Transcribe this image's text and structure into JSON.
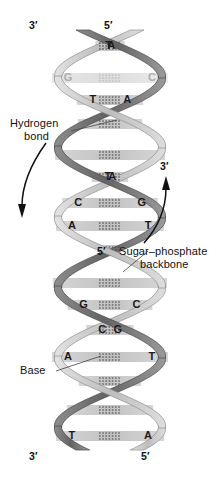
{
  "figure": {
    "type": "dna-double-helix",
    "background": "#ffffff",
    "strand_dark_color": "#6e6e6e",
    "strand_light_color": "#c9c9c9",
    "rung_color": "#c8c8c8",
    "text_color": "#111111"
  },
  "end_labels": {
    "top_left": "3′",
    "top_right": "5′",
    "middle_right": "3′",
    "middle_backbone": "5′",
    "bottom_left": "3′",
    "bottom_right": "5′"
  },
  "annotations": {
    "hydrogen_bond_line1": "Hydrogen",
    "hydrogen_bond_line2": "bond",
    "sugar_phosphate_line1": "Sugar–phosphate",
    "sugar_phosphate_line2": "backbone",
    "base": "Base"
  },
  "base_pairs": [
    {
      "index": 1,
      "left": "A",
      "right": "T",
      "y": 46,
      "labeled": true,
      "faded": false
    },
    {
      "index": 2,
      "left": "G",
      "right": "C",
      "y": 78,
      "labeled": true,
      "faded": true
    },
    {
      "index": 3,
      "left": "T",
      "right": "A",
      "y": 100,
      "labeled": true,
      "faded": false
    },
    {
      "index": 4,
      "left": "",
      "right": "",
      "y": 124,
      "labeled": false,
      "faded": false
    },
    {
      "index": 5,
      "left": "",
      "right": "",
      "y": 155,
      "labeled": false,
      "faded": false
    },
    {
      "index": 6,
      "left": "T",
      "right": "A",
      "y": 177,
      "labeled": true,
      "faded": false
    },
    {
      "index": 7,
      "left": "C",
      "right": "G",
      "y": 203,
      "labeled": true,
      "faded": false
    },
    {
      "index": 8,
      "left": "A",
      "right": "T",
      "y": 226,
      "labeled": true,
      "faded": false
    },
    {
      "index": 9,
      "left": "",
      "right": "",
      "y": 250,
      "labeled": false,
      "faded": false
    },
    {
      "index": 10,
      "left": "",
      "right": "",
      "y": 283,
      "labeled": false,
      "faded": false
    },
    {
      "index": 11,
      "left": "G",
      "right": "C",
      "y": 305,
      "labeled": true,
      "faded": false
    },
    {
      "index": 12,
      "left": "C",
      "right": "G",
      "y": 330,
      "labeled": true,
      "faded": false
    },
    {
      "index": 13,
      "left": "A",
      "right": "T",
      "y": 357,
      "labeled": true,
      "faded": false
    },
    {
      "index": 14,
      "left": "",
      "right": "",
      "y": 381,
      "labeled": false,
      "faded": false
    },
    {
      "index": 15,
      "left": "",
      "right": "",
      "y": 410,
      "labeled": false,
      "faded": false
    },
    {
      "index": 16,
      "left": "T",
      "right": "A",
      "y": 436,
      "labeled": true,
      "faded": false
    }
  ],
  "arrows": {
    "left_direction": "down",
    "right_direction": "up"
  }
}
